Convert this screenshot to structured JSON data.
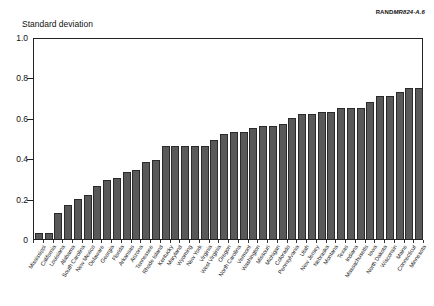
{
  "figure": {
    "source_credit_brand": "RAND",
    "source_credit_doc": "MR824-A.6",
    "y_axis_title": "Standard deviation"
  },
  "chart_data": {
    "type": "bar",
    "title": "",
    "subtitle": "",
    "xlabel": "",
    "ylabel": "Standard deviation",
    "ylim": [
      0,
      1.0
    ],
    "ytick_labels": [
      "0",
      "0.2",
      "0.4",
      "0.6",
      "0.8",
      "1.0"
    ],
    "ytick_values": [
      0,
      0.2,
      0.4,
      0.6,
      0.8,
      1.0
    ],
    "grid": false,
    "legend": "none",
    "bar_color": "#595959",
    "categories": [
      "Mississippi",
      "California",
      "Louisiana",
      "Alabama",
      "South Carolina",
      "New Mexico",
      "Delaware",
      "Georgia",
      "Florida",
      "Arkansas",
      "Arizona",
      "Tennessee",
      "Rhode Island",
      "Kentucky",
      "Maryland",
      "Wyoming",
      "New York",
      "Virginia",
      "West Virginia",
      "Oregon",
      "North Carolina",
      "Vermont",
      "Washington",
      "Missouri",
      "Michigan",
      "Colorado",
      "Pennsylvania",
      "Utah",
      "New Jersey",
      "Nebraska",
      "Montana",
      "Texas",
      "Indiana",
      "Massachusetts",
      "Iowa",
      "North Dakota",
      "Wisconsin",
      "Maine",
      "Connecticut",
      "Minnesota"
    ],
    "values": [
      0.03,
      0.03,
      0.13,
      0.17,
      0.2,
      0.22,
      0.26,
      0.29,
      0.3,
      0.33,
      0.34,
      0.38,
      0.39,
      0.46,
      0.46,
      0.46,
      0.46,
      0.46,
      0.49,
      0.52,
      0.53,
      0.53,
      0.55,
      0.56,
      0.56,
      0.57,
      0.6,
      0.62,
      0.62,
      0.63,
      0.63,
      0.65,
      0.65,
      0.65,
      0.68,
      0.71,
      0.71,
      0.73,
      0.75,
      0.75
    ]
  }
}
